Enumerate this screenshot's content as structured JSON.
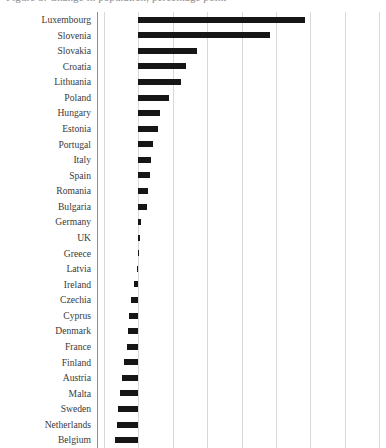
{
  "chart": {
    "title_clipped": "Figure 3. Change in population, percentage point",
    "axis_color": "#8d8d8d",
    "grid_color": "#d8d8d8",
    "bar_color": "#161616"
  },
  "chart_data": {
    "type": "bar",
    "orientation": "horizontal",
    "title": "Figure 3. Change in population, percentage point",
    "xlabel": "",
    "ylabel": "",
    "grid": true,
    "legend": false,
    "xlim": [
      -0.6,
      3.6
    ],
    "zero_baseline": 0,
    "gridline_values": [
      -0.5,
      0,
      0.5,
      1.0,
      1.5,
      2.0,
      2.5,
      3.0,
      3.5
    ],
    "categories": [
      "Luxembourg",
      "Slovenia",
      "Slovakia",
      "Croatia",
      "Lithuania",
      "Poland",
      "Hungary",
      "Estonia",
      "Portugal",
      "Italy",
      "Spain",
      "Romania",
      "Bulgaria",
      "Germany",
      "UK",
      "Greece",
      "Latvia",
      "Ireland",
      "Czechia",
      "Cyprus",
      "Denmark",
      "France",
      "Finland",
      "Austria",
      "Malta",
      "Sweden",
      "Netherlands",
      "Belgium"
    ],
    "values": [
      2.42,
      1.92,
      0.86,
      0.7,
      0.62,
      0.44,
      0.31,
      0.29,
      0.21,
      0.19,
      0.17,
      0.14,
      0.12,
      0.04,
      0.03,
      0.01,
      -0.02,
      -0.06,
      -0.1,
      -0.13,
      -0.15,
      -0.17,
      -0.21,
      -0.24,
      -0.27,
      -0.29,
      -0.31,
      -0.34
    ]
  }
}
